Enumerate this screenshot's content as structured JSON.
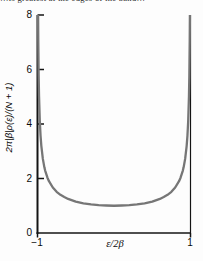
{
  "figure": {
    "top_cropped_text": "…is greatest at the edges of the band…",
    "background_color": "#fdfdfd"
  },
  "chart_data": {
    "type": "line",
    "title": "",
    "xlabel": "ε/2β",
    "ylabel": "2π|β|ρ(ε)/(N + 1)",
    "xlim": [
      -1,
      1
    ],
    "ylim": [
      0,
      8
    ],
    "x_ticks": [
      -1,
      1
    ],
    "y_ticks": [
      0,
      2,
      4,
      6,
      8
    ],
    "grid": false,
    "legend": false,
    "axis_color": "#141414",
    "curve_color": "#767676",
    "series": [
      {
        "name": "density-of-states",
        "formula": "y = 1 / sqrt(1 - x^2), clipped at y = 8",
        "points": [
          [
            -0.9922,
            8.0
          ],
          [
            -0.992,
            7.92
          ],
          [
            -0.99,
            7.09
          ],
          [
            -0.985,
            5.8
          ],
          [
            -0.98,
            5.03
          ],
          [
            -0.97,
            4.11
          ],
          [
            -0.96,
            3.57
          ],
          [
            -0.95,
            3.2
          ],
          [
            -0.93,
            2.72
          ],
          [
            -0.91,
            2.41
          ],
          [
            -0.9,
            2.29
          ],
          [
            -0.87,
            2.03
          ],
          [
            -0.85,
            1.9
          ],
          [
            -0.8,
            1.67
          ],
          [
            -0.75,
            1.51
          ],
          [
            -0.7,
            1.4
          ],
          [
            -0.65,
            1.32
          ],
          [
            -0.6,
            1.25
          ],
          [
            -0.5,
            1.15
          ],
          [
            -0.4,
            1.09
          ],
          [
            -0.3,
            1.05
          ],
          [
            -0.2,
            1.02
          ],
          [
            -0.1,
            1.01
          ],
          [
            0,
            1.0
          ],
          [
            0.1,
            1.01
          ],
          [
            0.2,
            1.02
          ],
          [
            0.3,
            1.05
          ],
          [
            0.4,
            1.09
          ],
          [
            0.5,
            1.15
          ],
          [
            0.6,
            1.25
          ],
          [
            0.65,
            1.32
          ],
          [
            0.7,
            1.4
          ],
          [
            0.75,
            1.51
          ],
          [
            0.8,
            1.67
          ],
          [
            0.85,
            1.9
          ],
          [
            0.87,
            2.03
          ],
          [
            0.9,
            2.29
          ],
          [
            0.91,
            2.41
          ],
          [
            0.93,
            2.72
          ],
          [
            0.95,
            3.2
          ],
          [
            0.96,
            3.57
          ],
          [
            0.97,
            4.11
          ],
          [
            0.98,
            5.03
          ],
          [
            0.985,
            5.8
          ],
          [
            0.99,
            7.09
          ],
          [
            0.992,
            7.92
          ],
          [
            0.9922,
            8.0
          ]
        ]
      }
    ]
  }
}
